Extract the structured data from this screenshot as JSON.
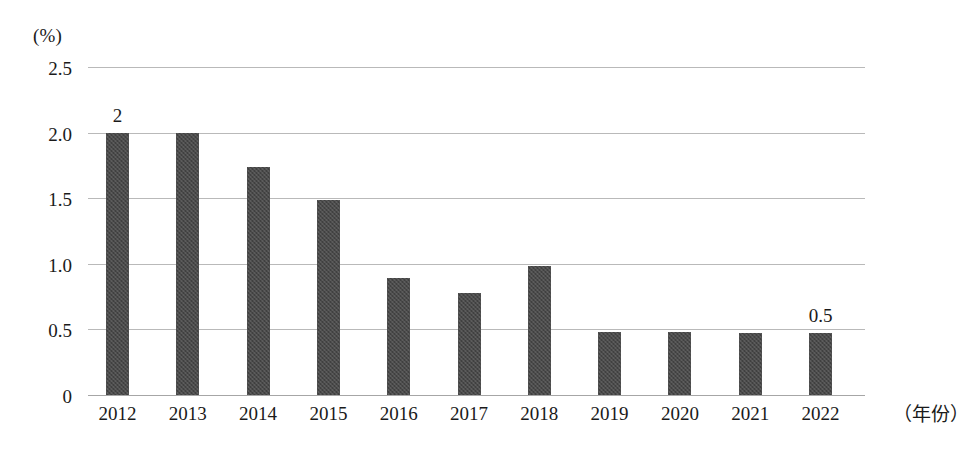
{
  "chart_data": {
    "type": "bar",
    "title": "",
    "subtitle": "",
    "xlabel": "（年份）",
    "ylabel": "(%)",
    "categories": [
      "2012",
      "2013",
      "2014",
      "2015",
      "2016",
      "2017",
      "2018",
      "2019",
      "2020",
      "2021",
      "2022"
    ],
    "values": [
      2.0,
      2.0,
      1.74,
      1.49,
      0.89,
      0.78,
      0.98,
      0.48,
      0.48,
      0.47,
      0.47
    ],
    "point_labels": [
      "2",
      "",
      "",
      "",
      "",
      "",
      "",
      "",
      "",
      "",
      "0.5"
    ],
    "ylim": [
      0,
      2.5
    ],
    "ytick_labels": [
      "2.5",
      "2.0",
      "1.5",
      "1.0",
      "0.5",
      "0"
    ],
    "ytick_values": [
      2.5,
      2.0,
      1.5,
      1.0,
      0.5,
      0
    ],
    "grid": true,
    "legend": false,
    "legend_position": "none",
    "series_color": "#4a4a4a",
    "gridline_color": "#b9b9b9",
    "background_color": "#ffffff"
  }
}
